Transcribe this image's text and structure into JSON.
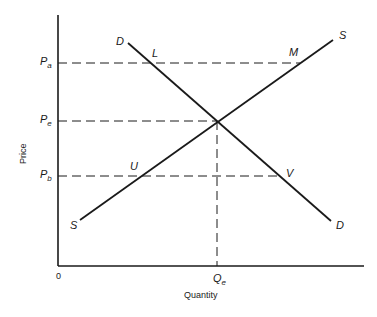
{
  "diagram": {
    "type": "supply-demand",
    "axes": {
      "x_label": "Quantity",
      "y_label": "Price",
      "origin_label": "0"
    },
    "price_levels": [
      {
        "id": "Pa",
        "main": "P",
        "sub": "a"
      },
      {
        "id": "Pe",
        "main": "P",
        "sub": "e"
      },
      {
        "id": "Pb",
        "main": "P",
        "sub": "b"
      }
    ],
    "quantity_levels": [
      {
        "id": "Qe",
        "main": "Q",
        "sub": "e"
      }
    ],
    "curves": {
      "demand": {
        "start_label": "D",
        "end_label": "D"
      },
      "supply": {
        "start_label": "S",
        "end_label": "S"
      }
    },
    "points": {
      "L": "L",
      "M": "M",
      "U": "U",
      "V": "V"
    }
  }
}
